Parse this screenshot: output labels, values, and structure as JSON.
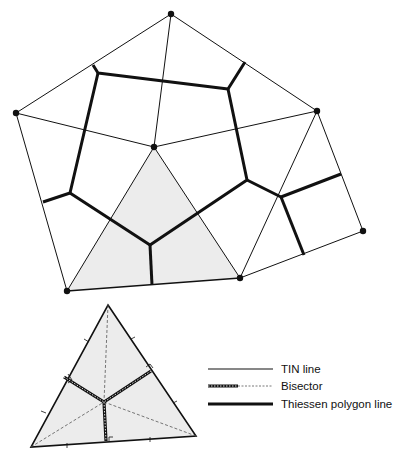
{
  "diagram": {
    "title": "",
    "colors": {
      "line": "#111111",
      "fill": "#ececec",
      "background": "#ffffff"
    },
    "main": {
      "points": [
        {
          "id": "top",
          "x": 171,
          "y": 14
        },
        {
          "id": "left",
          "x": 16,
          "y": 113
        },
        {
          "id": "right",
          "x": 317,
          "y": 111
        },
        {
          "id": "center",
          "x": 154,
          "y": 147
        },
        {
          "id": "far_right",
          "x": 363,
          "y": 231
        },
        {
          "id": "bottom_right",
          "x": 240,
          "y": 278
        },
        {
          "id": "bottom_left",
          "x": 67,
          "y": 291
        }
      ],
      "highlighted_triangle": [
        "center",
        "bottom_left",
        "bottom_right"
      ]
    },
    "inset": {
      "triangle": {
        "apex": [
          108,
          305
        ],
        "right": [
          196,
          436
        ],
        "left": [
          31,
          447
        ]
      },
      "circumcenter": [
        104,
        402
      ]
    },
    "legend": {
      "items": [
        {
          "id": "tin",
          "label": "TIN line"
        },
        {
          "id": "bisector",
          "label": "Bisector"
        },
        {
          "id": "thiessen",
          "label": "Thiessen polygon line"
        }
      ]
    }
  }
}
